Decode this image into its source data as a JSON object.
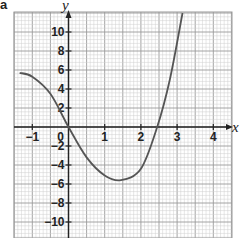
{
  "panel_label": "a",
  "chart_data": {
    "type": "line",
    "title": "",
    "xlabel": "x",
    "ylabel": "y",
    "xlim": [
      -1.5,
      4.5
    ],
    "ylim": [
      -12,
      12
    ],
    "grid": true,
    "legend": null,
    "x_ticks": [
      -1,
      0,
      1,
      2,
      3,
      4
    ],
    "x_tick_labels": [
      "−1",
      "0",
      "1",
      "2",
      "3",
      "4"
    ],
    "y_ticks": [
      -10,
      -8,
      -6,
      -4,
      -2,
      2,
      4,
      6,
      8,
      10
    ],
    "y_tick_labels": [
      "−10",
      "−8",
      "−6",
      "−4",
      "−2",
      "2",
      "4",
      "6",
      "8",
      "10"
    ],
    "series": [
      {
        "name": "curve",
        "color": "#555555",
        "x": [
          -1.35,
          -1.0,
          -0.5,
          0.0,
          0.5,
          1.0,
          1.45,
          2.0,
          2.45,
          2.8,
          3.15
        ],
        "y": [
          5.7,
          5.3,
          3.5,
          0.0,
          -3.2,
          -5.1,
          -5.6,
          -4.4,
          0.0,
          5.0,
          12.0
        ]
      }
    ],
    "annotations": {
      "x_intercepts": [
        0,
        2.45
      ],
      "minimum": {
        "x": 1.45,
        "y": -5.6
      }
    }
  },
  "colors": {
    "grid_minor": "#cfcfcf",
    "grid_major": "#9a9a9a",
    "axis": "#222222",
    "curve": "#555555"
  }
}
